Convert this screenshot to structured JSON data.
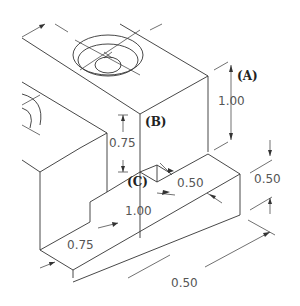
{
  "drawing": {
    "type": "isometric-technical-drawing",
    "labels": {
      "A": "(A)",
      "B": "(B)",
      "C": "(C)"
    },
    "dimensions": {
      "upper_block_height": "1.00",
      "step_height": "0.75",
      "ledge_depth": "0.50",
      "ledge_height": "0.50",
      "ledge_length": "1.00",
      "base_depth": "0.75",
      "overall_width": "0.50"
    },
    "colors": {
      "line": "#333333",
      "dimension_text": "#555555",
      "label_text": "#222222"
    }
  }
}
